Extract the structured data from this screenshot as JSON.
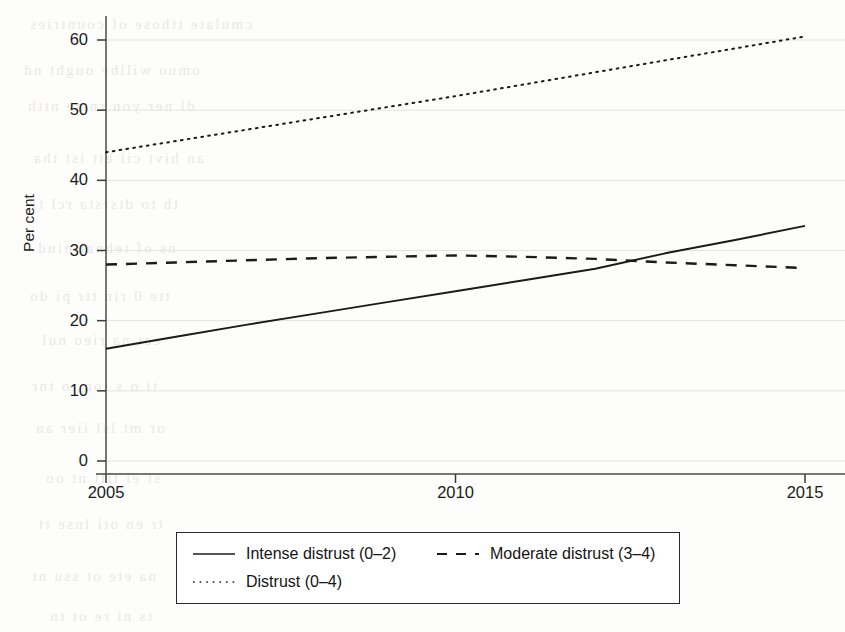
{
  "figure": {
    "background_color": "#fdfdfc",
    "ink_color": "#1b1b1b",
    "gridline_color": "#e3e3e3"
  },
  "axis": {
    "y_title": "Per cent",
    "y_ticks": [
      "0",
      "10",
      "20",
      "30",
      "40",
      "50",
      "60"
    ],
    "x_ticks": [
      "2005",
      "2010",
      "2015"
    ]
  },
  "legend": {
    "entries": [
      {
        "label": "Intense distrust (0–2)",
        "style": "solid"
      },
      {
        "label": "Moderate distrust (3–4)",
        "style": "dashed"
      },
      {
        "label": "Distrust (0–4)",
        "style": "dotted"
      }
    ]
  },
  "ghost_text": [
    {
      "text": "cmulate  tthose  of  countries",
      "x": 28,
      "y": 16
    },
    {
      "text": "omuo  willbe     ought  nd",
      "x": 22,
      "y": 62
    },
    {
      "text": "dl      ner  yon  rnme  ntth",
      "x": 26,
      "y": 98
    },
    {
      "text": "an  hivt  cii      ett  ist  tha",
      "x": 32,
      "y": 150
    },
    {
      "text": "th      to    dtsrsta     rcl ti",
      "x": 30,
      "y": 196
    },
    {
      "text": "ns     of    tehnai   niud",
      "x": 36,
      "y": 240
    },
    {
      "text": "tte  0    rin       ttr  pi  do",
      "x": 28,
      "y": 288
    },
    {
      "text": "eat     na    rieo      nul",
      "x": 40,
      "y": 332
    },
    {
      "text": "ti   o   s      ion  to    tnr",
      "x": 30,
      "y": 378
    },
    {
      "text": "or     mt     lsl   iier  an",
      "x": 34,
      "y": 420
    },
    {
      "text": "st     ei   tilt    nt   oo",
      "x": 44,
      "y": 470
    },
    {
      "text": "tr  en     oti     lnse  rt",
      "x": 36,
      "y": 516
    },
    {
      "text": "na     ete   ot     ssu  nt",
      "x": 30,
      "y": 568
    },
    {
      "text": "ts    ni      re     ot  tn",
      "x": 48,
      "y": 608
    }
  ],
  "chart_data": {
    "type": "line",
    "title": "",
    "xlabel": "",
    "ylabel": "Per cent",
    "xlim": [
      2005,
      2015
    ],
    "ylim": [
      0,
      63
    ],
    "grid": true,
    "legend_position": "bottom",
    "x": [
      2005,
      2006,
      2007,
      2008,
      2009,
      2010,
      2011,
      2012,
      2013,
      2014,
      2015
    ],
    "series": [
      {
        "name": "Intense distrust (0–2)",
        "style": "solid",
        "values": [
          16.0,
          17.7,
          19.4,
          21.0,
          22.6,
          24.2,
          25.8,
          27.4,
          29.6,
          31.5,
          33.5
        ]
      },
      {
        "name": "Moderate distrust (3–4)",
        "style": "dashed",
        "values": [
          28.0,
          28.3,
          28.6,
          28.9,
          29.1,
          29.3,
          29.1,
          28.8,
          28.3,
          27.9,
          27.5
        ]
      },
      {
        "name": "Distrust (0–4)",
        "style": "dotted",
        "values": [
          44.0,
          45.6,
          47.2,
          48.8,
          50.4,
          52.0,
          53.7,
          55.4,
          57.1,
          58.8,
          60.5
        ]
      }
    ],
    "annotations": [
      "Solid and dashed series cross at approximately 2012.5 near 28.5 per cent"
    ]
  }
}
